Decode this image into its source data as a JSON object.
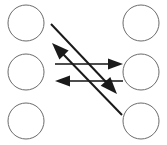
{
  "figure": {
    "title": "",
    "width": 167,
    "height": 145,
    "background_color": "#ffffff"
  },
  "style": {
    "node_stroke_color": "#6b6b6b",
    "node_fill_color": "#ffffff",
    "node_stroke_width": 1,
    "horizontal_edge_color": "#4d4d4d",
    "diagonal_edge_color": "#1a1a1a",
    "arrowhead_color": "#1a1a1a",
    "edge_stroke_width": 2
  },
  "nodes": [
    {
      "id": "left-top",
      "label": "",
      "column": "left",
      "row": "top",
      "cx": 26,
      "cy": 23,
      "r": 18
    },
    {
      "id": "left-middle",
      "label": "",
      "column": "left",
      "row": "middle",
      "cx": 26,
      "cy": 72,
      "r": 18
    },
    {
      "id": "left-bottom",
      "label": "",
      "column": "left",
      "row": "bottom",
      "cx": 26,
      "cy": 121,
      "r": 18
    },
    {
      "id": "right-top",
      "label": "",
      "column": "right",
      "row": "top",
      "cx": 141,
      "cy": 23,
      "r": 18
    },
    {
      "id": "right-middle",
      "label": "",
      "column": "right",
      "row": "middle",
      "cx": 141,
      "cy": 72,
      "r": 18
    },
    {
      "id": "right-bottom",
      "label": "",
      "column": "right",
      "row": "bottom",
      "cx": 141,
      "cy": 121,
      "r": 18
    }
  ],
  "edges": [
    {
      "id": "edge-middle-rightward",
      "label": "",
      "kind": "horizontal",
      "direction": "right",
      "from": "left-middle",
      "to": "right-middle",
      "x1": 55,
      "y1": 64,
      "x2": 110,
      "y2": 64,
      "arrow_tip_x": 123,
      "arrow_tip_y": 64
    },
    {
      "id": "edge-middle-leftward",
      "label": "",
      "kind": "horizontal",
      "direction": "left",
      "from": "right-middle",
      "to": "left-middle",
      "x1": 123,
      "y1": 81,
      "x2": 68,
      "y2": 81,
      "arrow_tip_x": 55,
      "arrow_tip_y": 81
    },
    {
      "id": "edge-diagonal-upleft",
      "label": "",
      "kind": "diagonal",
      "direction": "up-left",
      "from": "right-bottom",
      "to": "left-top",
      "x1": 122,
      "y1": 115,
      "x2": 62,
      "y2": 53,
      "arrow_tip_x": 52,
      "arrow_tip_y": 43
    },
    {
      "id": "edge-diagonal-downright",
      "label": "",
      "kind": "diagonal",
      "direction": "down-right",
      "from": "left-top",
      "to": "right-bottom",
      "x1": 51,
      "y1": 24,
      "x2": 106,
      "y2": 82,
      "arrow_tip_x": 117,
      "arrow_tip_y": 94
    }
  ]
}
